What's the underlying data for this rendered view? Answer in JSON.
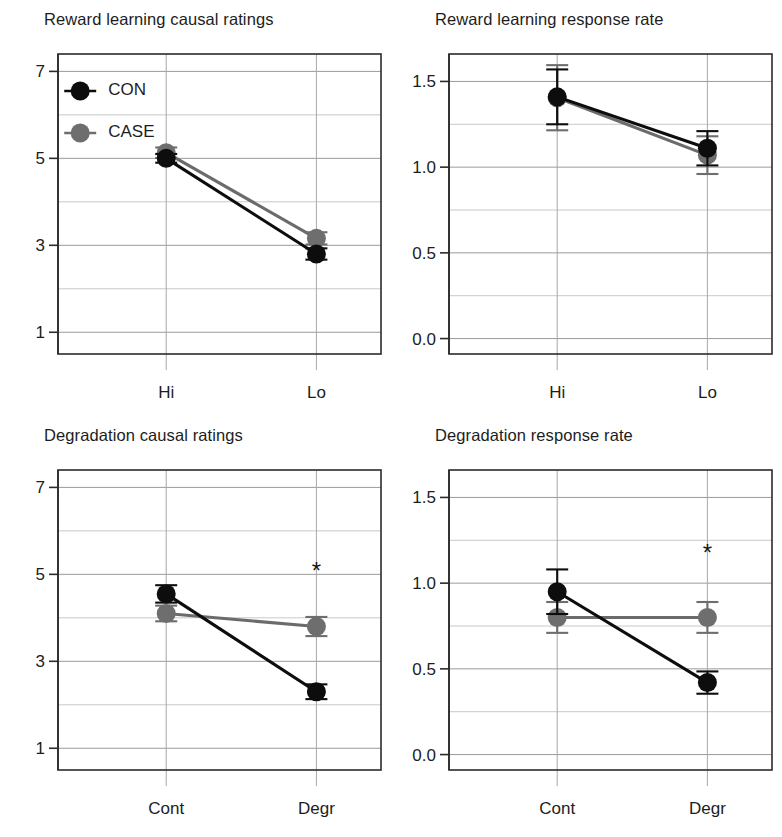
{
  "figure": {
    "width": 782,
    "height": 837,
    "background": "#ffffff",
    "series_colors": {
      "CON": "#0d0d0d",
      "CASE": "#6e6e6e"
    },
    "significance_marker": "*"
  },
  "legend": {
    "position": "top-left of panel 1",
    "entries": [
      {
        "name": "CON",
        "label": "CON",
        "color": "#0d0d0d"
      },
      {
        "name": "CASE",
        "label": "CASE",
        "color": "#6e6e6e"
      }
    ]
  },
  "chart_data": [
    {
      "id": "reward-learning-causal-ratings",
      "type": "line",
      "title": "Reward learning causal ratings",
      "xlabel": "",
      "ylabel": "",
      "categories": [
        "Hi",
        "Lo"
      ],
      "ylim": [
        0.5,
        7.4
      ],
      "yticks": [
        1,
        3,
        5,
        7
      ],
      "ytick_labels": [
        "1",
        "3",
        "5",
        "7"
      ],
      "yminor": [
        2,
        4,
        6
      ],
      "grid": true,
      "legend": true,
      "annotations": [],
      "series": [
        {
          "name": "CON",
          "color": "#0d0d0d",
          "values": [
            5.0,
            2.8
          ],
          "errors": [
            0.1,
            0.13
          ]
        },
        {
          "name": "CASE",
          "color": "#6e6e6e",
          "values": [
            5.13,
            3.16
          ],
          "errors": [
            0.12,
            0.14
          ]
        }
      ]
    },
    {
      "id": "reward-learning-response-rate",
      "type": "line",
      "title": "Reward learning response rate",
      "xlabel": "",
      "ylabel": "",
      "categories": [
        "Hi",
        "Lo"
      ],
      "ylim": [
        -0.09,
        1.66
      ],
      "yticks": [
        0.0,
        0.5,
        1.0,
        1.5
      ],
      "ytick_labels": [
        "0.0",
        "0.5",
        "1.0",
        "1.5"
      ],
      "yminor": [
        0.25,
        0.75,
        1.25
      ],
      "grid": true,
      "legend": false,
      "annotations": [],
      "series": [
        {
          "name": "CON",
          "color": "#0d0d0d",
          "values": [
            1.41,
            1.11
          ],
          "errors": [
            0.16,
            0.1
          ]
        },
        {
          "name": "CASE",
          "color": "#6e6e6e",
          "values": [
            1.405,
            1.07
          ],
          "errors": [
            0.19,
            0.11
          ]
        }
      ]
    },
    {
      "id": "degradation-causal-ratings",
      "type": "line",
      "title": "Degradation causal ratings",
      "xlabel": "",
      "ylabel": "",
      "categories": [
        "Cont",
        "Degr"
      ],
      "ylim": [
        0.5,
        7.4
      ],
      "yticks": [
        1,
        3,
        5,
        7
      ],
      "ytick_labels": [
        "1",
        "3",
        "5",
        "7"
      ],
      "yminor": [
        2,
        4,
        6
      ],
      "grid": true,
      "legend": false,
      "annotations": [
        {
          "text": "*",
          "category": "Degr",
          "y": 4.9,
          "name": "significance-star"
        }
      ],
      "series": [
        {
          "name": "CON",
          "color": "#0d0d0d",
          "values": [
            4.55,
            2.3
          ],
          "errors": [
            0.2,
            0.17
          ]
        },
        {
          "name": "CASE",
          "color": "#6e6e6e",
          "values": [
            4.1,
            3.8
          ],
          "errors": [
            0.18,
            0.22
          ]
        }
      ]
    },
    {
      "id": "degradation-response-rate",
      "type": "line",
      "title": "Degradation response rate",
      "xlabel": "",
      "ylabel": "",
      "categories": [
        "Cont",
        "Degr"
      ],
      "ylim": [
        -0.09,
        1.66
      ],
      "yticks": [
        0.0,
        0.5,
        1.0,
        1.5
      ],
      "ytick_labels": [
        "0.0",
        "0.5",
        "1.0",
        "1.5"
      ],
      "yminor": [
        0.25,
        0.75,
        1.25
      ],
      "grid": true,
      "legend": false,
      "annotations": [
        {
          "text": "*",
          "category": "Degr",
          "y": 1.13,
          "name": "significance-star"
        }
      ],
      "series": [
        {
          "name": "CON",
          "color": "#0d0d0d",
          "values": [
            0.95,
            0.42
          ],
          "errors": [
            0.13,
            0.065
          ]
        },
        {
          "name": "CASE",
          "color": "#6e6e6e",
          "values": [
            0.8,
            0.8
          ],
          "errors": [
            0.09,
            0.09
          ]
        }
      ]
    }
  ]
}
